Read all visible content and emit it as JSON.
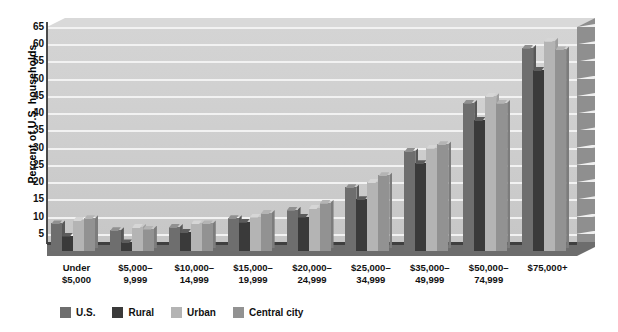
{
  "chart_data": {
    "type": "bar",
    "title": "",
    "xlabel": "",
    "ylabel": "Percent of U.S. households",
    "ylim": [
      0,
      65
    ],
    "ytick_step": 5,
    "grid": true,
    "legend_position": "bottom-left",
    "yticks": [
      "65",
      "60",
      "55",
      "50",
      "45",
      "40",
      "35",
      "30",
      "25",
      "20",
      "15",
      "10",
      "5"
    ],
    "categories": [
      "Under\n$5,000",
      "$5,000–\n9,999",
      "$10,000–\n14,999",
      "$15,000–\n19,999",
      "$20,000–\n24,999",
      "$25,000–\n34,999",
      "$35,000–\n49,999",
      "$50,000–\n74,999",
      "$75,000+"
    ],
    "category_lines": [
      [
        "Under",
        "$5,000"
      ],
      [
        "$5,000–",
        "9,999"
      ],
      [
        "$10,000–",
        "14,999"
      ],
      [
        "$15,000–",
        "19,999"
      ],
      [
        "$20,000–",
        "24,999"
      ],
      [
        "$25,000–",
        "34,999"
      ],
      [
        "$35,000–",
        "49,999"
      ],
      [
        "$50,000–",
        "74,999"
      ],
      [
        "$75,000+",
        ""
      ]
    ],
    "series": [
      {
        "name": "U.S.",
        "color": "#6e6e6e",
        "values": [
          8,
          6,
          7,
          9.5,
          12,
          18.5,
          29,
          43,
          59
        ]
      },
      {
        "name": "Rural",
        "color": "#3a3a3a",
        "values": [
          4.5,
          2.5,
          5.5,
          8.5,
          10,
          15,
          25.5,
          38,
          52.5
        ]
      },
      {
        "name": "Urban",
        "color": "#b4b4b4",
        "values": [
          9,
          7,
          8,
          10,
          12.5,
          20,
          30,
          45,
          61
        ]
      },
      {
        "name": "Central city",
        "color": "#929292",
        "values": [
          9.5,
          6.5,
          8,
          11,
          14,
          22,
          31,
          43,
          58.5
        ]
      }
    ]
  },
  "legend": {
    "items": [
      {
        "label": "U.S.",
        "color": "#6e6e6e"
      },
      {
        "label": "Rural",
        "color": "#3a3a3a"
      },
      {
        "label": "Urban",
        "color": "#b4b4b4"
      },
      {
        "label": "Central city",
        "color": "#929292"
      }
    ]
  },
  "colors": {
    "plot_background": "#cfcfcf",
    "gridline": "#f2f2f2",
    "axis": "#4a4a4a",
    "floor": "#6d6d6d",
    "text": "#111111"
  }
}
